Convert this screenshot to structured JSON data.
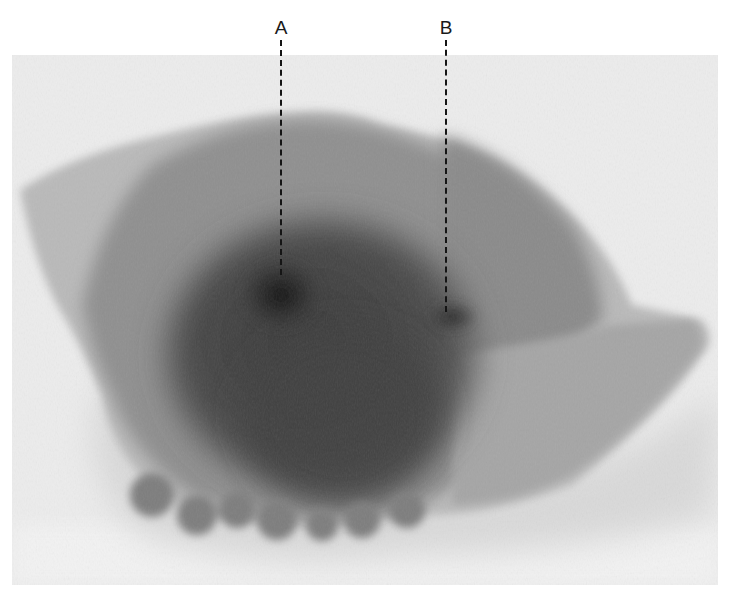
{
  "figure": {
    "type": "radiograph of specimen",
    "background_color": "#ffffff",
    "photo_background_color": "#ececec",
    "specimen_colors": {
      "light_tissue": "#b9b9b9",
      "mid_tissue": "#8f8f8f",
      "dense_tissue": "#5a5a5a",
      "densest_core": "#1e1e1e"
    },
    "annotations": [
      {
        "label": "A",
        "x": 281,
        "label_y": 18,
        "line_top": 40,
        "line_bottom": 275
      },
      {
        "label": "B",
        "x": 446,
        "label_y": 18,
        "line_top": 40,
        "line_bottom": 312
      }
    ]
  }
}
